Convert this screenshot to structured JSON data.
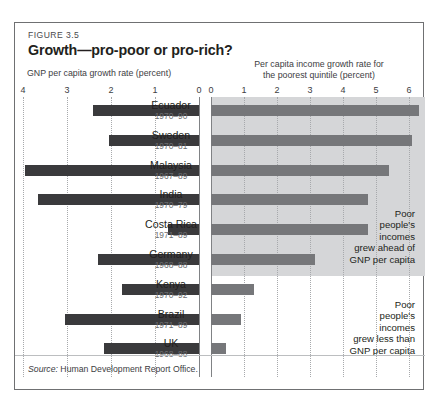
{
  "figure": {
    "number": "FIGURE 3.5",
    "title": "Growth—pro-poor or pro-rich?",
    "source_word": "Source:",
    "source_text": " Human Development Report Office."
  },
  "axes": {
    "left_caption": "GNP per capita growth rate (percent)",
    "right_caption_line1": "Per capita income growth rate for",
    "right_caption_line2": "the poorest quintile (percent)",
    "left_ticks": [
      "4",
      "3",
      "2",
      "1",
      "0"
    ],
    "right_ticks": [
      "0",
      "1",
      "2",
      "3",
      "4",
      "5",
      "6"
    ],
    "left_max": 4,
    "right_max": 6.5
  },
  "annotations": {
    "top": "Poor\npeople's\nincomes\ngrew ahead of\nGNP per capita",
    "bottom": "Poor\npeople's\nincomes\ngrew less than\nGNP per capita"
  },
  "colors": {
    "bar_left": "#3a3a3c",
    "bar_right": "#76777a",
    "band": "#d5d6d8",
    "frame": "#6f7072",
    "gridline": "#a7a9ac"
  },
  "chart_data": {
    "type": "bar",
    "title": "Growth—pro-poor or pro-rich?",
    "orientation": "horizontal",
    "layout": "back-to-back paired bars",
    "grid": true,
    "legend": "none",
    "categories": [
      "Ecuador",
      "Sweden",
      "Malaysia",
      "India",
      "Costa Rica",
      "Germany",
      "Kenya",
      "Brazil",
      "UK"
    ],
    "period_labels": [
      "1970–90",
      "1970–81",
      "1967–89",
      "1970–79",
      "1971–89",
      "1968–88",
      "1970–92",
      "1971–89",
      "1968–88"
    ],
    "series": [
      {
        "name": "GNP per capita growth rate (percent)",
        "side": "left",
        "xlabel": "GNP per capita growth rate (percent)",
        "xlim": [
          4,
          0
        ],
        "ticks": [
          4,
          3,
          2,
          1,
          0
        ],
        "values": [
          2.4,
          2.05,
          3.95,
          3.65,
          0.7,
          2.3,
          1.75,
          3.05,
          2.15
        ]
      },
      {
        "name": "Per capita income growth rate for the poorest quintile (percent)",
        "side": "right",
        "xlabel": "Per capita income growth rate for the poorest quintile (percent)",
        "xlim": [
          0,
          6.5
        ],
        "ticks": [
          0,
          1,
          2,
          3,
          4,
          5,
          6
        ],
        "values": [
          6.3,
          6.1,
          5.4,
          4.75,
          4.75,
          3.15,
          1.3,
          0.9,
          0.45
        ]
      }
    ],
    "shaded_rows": [
      "Ecuador",
      "Sweden",
      "Malaysia",
      "India",
      "Costa Rica",
      "Germany"
    ],
    "shaded_note": "Poor people's incomes grew ahead of GNP per capita",
    "unshaded_note": "Poor people's incomes grew less than GNP per capita"
  }
}
